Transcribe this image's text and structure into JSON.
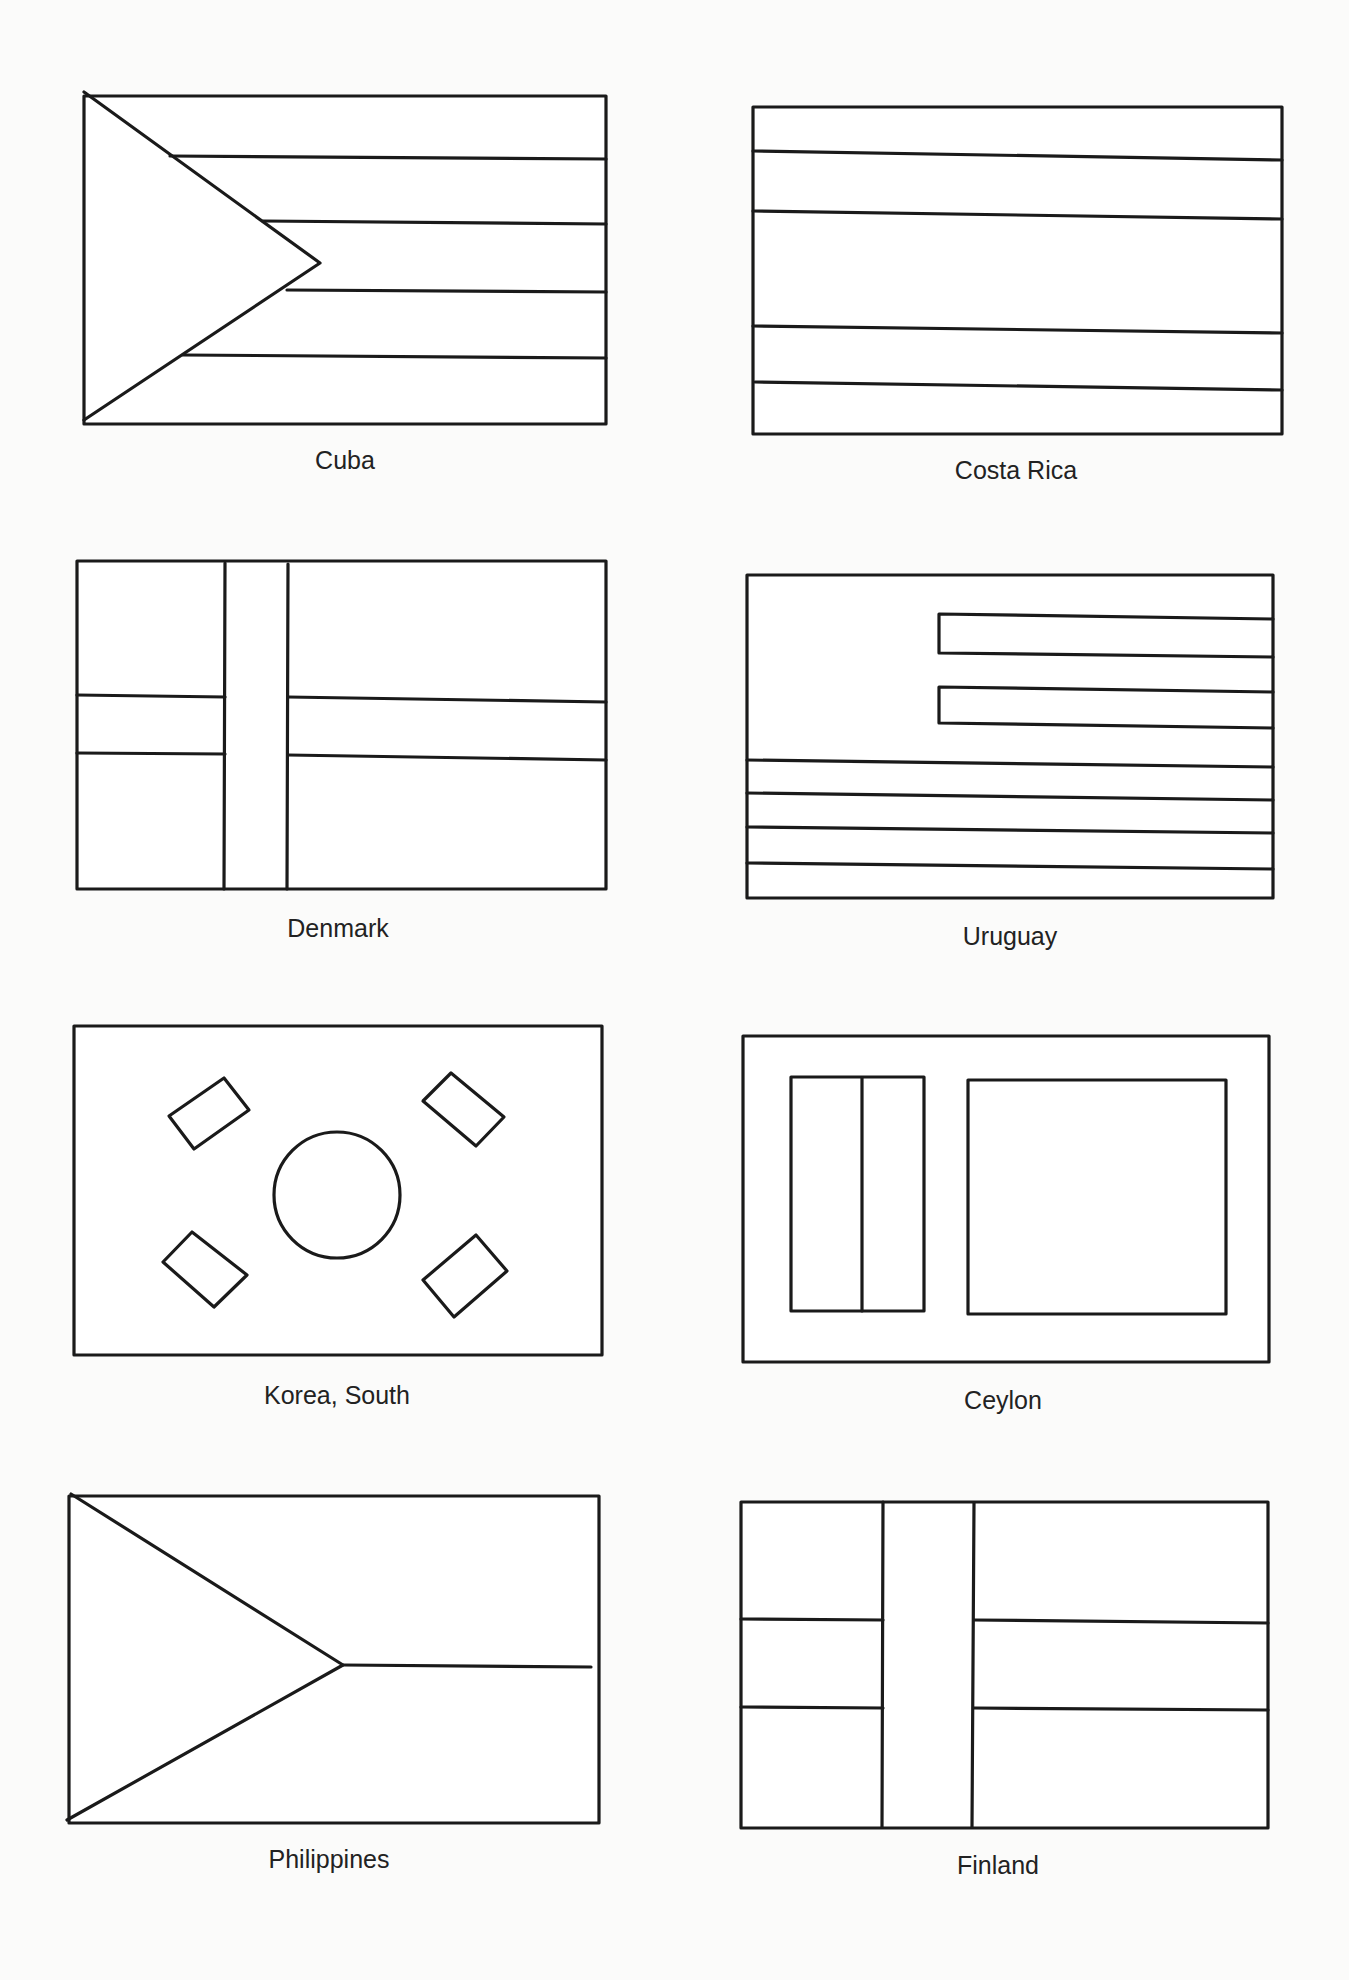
{
  "page": {
    "background": "#fbfbfa",
    "line_color": "#1a1a1a",
    "line_width": 3.2
  },
  "flags": [
    {
      "id": "cuba",
      "label": "Cuba",
      "label_pos": [
        345,
        448
      ],
      "rect": [
        84,
        96,
        606,
        424
      ],
      "lines": [
        [
          170,
          156,
          606,
          159
        ],
        [
          263,
          221,
          606,
          224
        ],
        [
          287,
          290,
          606,
          292
        ],
        [
          183,
          355,
          606,
          358
        ]
      ],
      "polylines": [
        [
          [
            84,
            92
          ],
          [
            320,
            263
          ],
          [
            84,
            420
          ]
        ]
      ]
    },
    {
      "id": "costa-rica",
      "label": "Costa Rica",
      "label_pos": [
        1016,
        458
      ],
      "rect": [
        753,
        107,
        1282,
        434
      ],
      "lines": [
        [
          753,
          151,
          1282,
          160
        ],
        [
          753,
          211,
          1282,
          219
        ],
        [
          753,
          326,
          1282,
          333
        ],
        [
          755,
          382,
          1282,
          390
        ]
      ]
    },
    {
      "id": "denmark",
      "label": "Denmark",
      "label_pos": [
        338,
        916
      ],
      "rect": [
        77,
        561,
        606,
        889
      ],
      "lines": [
        [
          77,
          695,
          225,
          697
        ],
        [
          288,
          697,
          606,
          702
        ],
        [
          77,
          753,
          225,
          754
        ],
        [
          288,
          755,
          606,
          760
        ],
        [
          225,
          563,
          224,
          889
        ],
        [
          288,
          564,
          287,
          889
        ]
      ]
    },
    {
      "id": "uruguay",
      "label": "Uruguay",
      "label_pos": [
        1010,
        924
      ],
      "rect": [
        747,
        575,
        1273,
        898
      ],
      "lines": [
        [
          747,
          760,
          1273,
          767
        ],
        [
          747,
          793,
          1273,
          800
        ],
        [
          747,
          827,
          1273,
          833
        ],
        [
          747,
          863,
          1273,
          869
        ]
      ],
      "polylines": [
        [
          [
            1273,
            619
          ],
          [
            939,
            614
          ],
          [
            939,
            653
          ],
          [
            1273,
            657
          ]
        ],
        [
          [
            1273,
            692
          ],
          [
            939,
            687
          ],
          [
            939,
            723
          ],
          [
            1273,
            728
          ]
        ]
      ]
    },
    {
      "id": "korea-south",
      "label": "Korea, South",
      "label_pos": [
        337,
        1383
      ],
      "rect": [
        74,
        1026,
        602,
        1355
      ],
      "circle": [
        337,
        1195,
        63
      ],
      "polygons": [
        [
          [
            169,
            1116
          ],
          [
            224,
            1078
          ],
          [
            249,
            1110
          ],
          [
            194,
            1149
          ]
        ],
        [
          [
            423,
            1101
          ],
          [
            451,
            1073
          ],
          [
            504,
            1117
          ],
          [
            476,
            1146
          ]
        ],
        [
          [
            163,
            1262
          ],
          [
            192,
            1232
          ],
          [
            247,
            1275
          ],
          [
            214,
            1307
          ]
        ],
        [
          [
            423,
            1280
          ],
          [
            476,
            1235
          ],
          [
            507,
            1271
          ],
          [
            454,
            1317
          ]
        ]
      ]
    },
    {
      "id": "ceylon",
      "label": "Ceylon",
      "label_pos": [
        1003,
        1388
      ],
      "rect": [
        743,
        1036,
        1269,
        1362
      ],
      "inner_rects": [
        [
          791,
          1077,
          924,
          1311
        ],
        [
          968,
          1080,
          1226,
          1314
        ]
      ],
      "lines": [
        [
          862,
          1078,
          862,
          1311
        ]
      ]
    },
    {
      "id": "philippines",
      "label": "Philippines",
      "label_pos": [
        329,
        1847
      ],
      "rect": [
        69,
        1496,
        599,
        1823
      ],
      "lines": [
        [
          343,
          1665,
          591,
          1667
        ]
      ],
      "polylines": [
        [
          [
            71,
            1494
          ],
          [
            343,
            1665
          ],
          [
            67,
            1820
          ]
        ]
      ]
    },
    {
      "id": "finland",
      "label": "Finland",
      "label_pos": [
        998,
        1853
      ],
      "rect": [
        741,
        1502,
        1268,
        1828
      ],
      "lines": [
        [
          741,
          1619,
          883,
          1620
        ],
        [
          974,
          1620,
          1268,
          1623
        ],
        [
          741,
          1707,
          883,
          1708
        ],
        [
          974,
          1708,
          1268,
          1710
        ],
        [
          883,
          1502,
          882,
          1827
        ],
        [
          974,
          1503,
          972,
          1827
        ]
      ]
    }
  ]
}
